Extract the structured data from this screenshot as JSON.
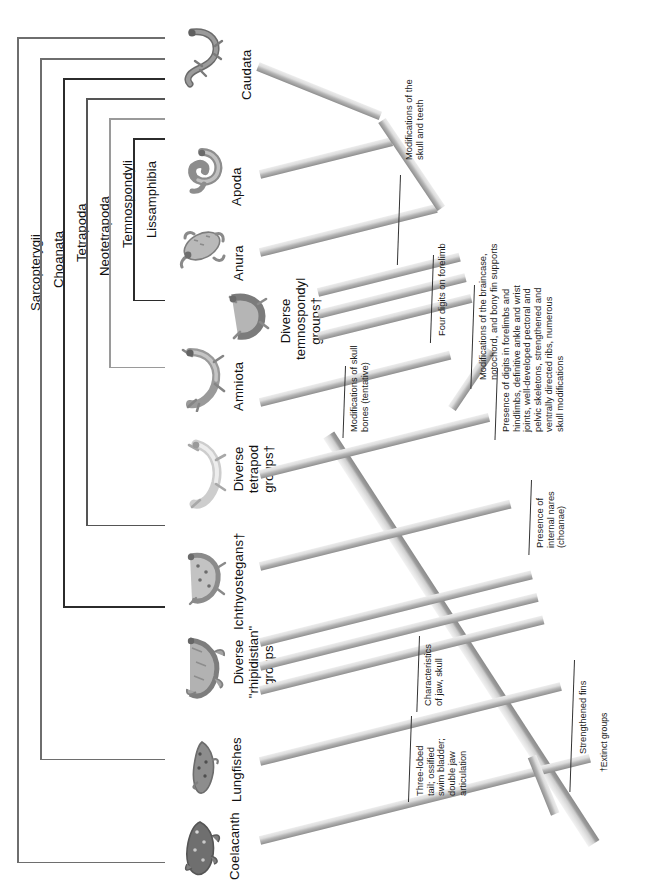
{
  "figure": {
    "type": "cladogram",
    "orientation": "rotated-90-ccw"
  },
  "clades": [
    {
      "id": "sarcopterygii",
      "label": "Sarcopterygii"
    },
    {
      "id": "choanata",
      "label": "Choanata"
    },
    {
      "id": "tetrapoda",
      "label": "Tetrapoda"
    },
    {
      "id": "neotetrapoda",
      "label": "Neotetrapoda"
    },
    {
      "id": "temnospondyli",
      "label": "Temnospondyli"
    },
    {
      "id": "lissamphibia",
      "label": "Lissamphibia"
    }
  ],
  "taxa": [
    {
      "id": "caudata",
      "label": "Caudata",
      "icon": "salamander-icon"
    },
    {
      "id": "apoda",
      "label": "Apoda",
      "icon": "caecilian-icon"
    },
    {
      "id": "anura",
      "label": "Anura",
      "icon": "frog-icon"
    },
    {
      "id": "temnospondyl",
      "label": "Diverse\ntemnospondyl\ngroups†",
      "icon": "temnospondyl-icon"
    },
    {
      "id": "amniota",
      "label": "Amniota",
      "icon": "lizard-icon"
    },
    {
      "id": "tetrapodgrp",
      "label": "Diverse\ntetrapod\ngroups†",
      "icon": "early-tetrapod-icon"
    },
    {
      "id": "ichthyostegans",
      "label": "Ichthyostegans†",
      "icon": "ichthyostega-icon"
    },
    {
      "id": "rhipidistian",
      "label": "Diverse\n\"rhipidistian\"\ngroups†",
      "icon": "rhipidistian-icon"
    },
    {
      "id": "lungfishes",
      "label": "Lungfishes",
      "icon": "lungfish-icon"
    },
    {
      "id": "coelacanth",
      "label": "Coelacanth",
      "icon": "coelacanth-icon"
    }
  ],
  "characters": [
    {
      "id": "c1",
      "text": "Modifications of the\nskull and teeth"
    },
    {
      "id": "c2",
      "text": "Four digits on forelimb"
    },
    {
      "id": "c3",
      "text": "Modifications of the braincase,\nnotochord, and bony fin supports"
    },
    {
      "id": "c4",
      "text": "Modifications of skull\nbones (tentative)"
    },
    {
      "id": "c5",
      "text": "Presence of digits in forelimbs and\nhindlimbs, definitive ankle and wrist\njoints, well-developed pectoral and\npelvic skeletons, strengthened and\nventrally directed ribs, numerous\nskull modifications"
    },
    {
      "id": "c6",
      "text": "Presence of\ninternal nares\n(choanae)"
    },
    {
      "id": "c7",
      "text": "Characteristics\nof jaw, skull"
    },
    {
      "id": "c8",
      "text": "Three-lobed\ntail; ossified\nswim bladder;\ndouble jaw\narticulation"
    },
    {
      "id": "c9",
      "text": "Strengthened fins"
    }
  ],
  "footnote": "†Extinct groups",
  "colors": {
    "background": "#ffffff",
    "bracket_default": "#6e6e6e",
    "bracket_dark": "#2b2b2b",
    "bracket_light": "#9a9a9a",
    "branch_top": "#e2e2e2",
    "branch_shadow": "#8e8e8e",
    "text": "#1a1a1a",
    "leader_line": "#333333"
  }
}
